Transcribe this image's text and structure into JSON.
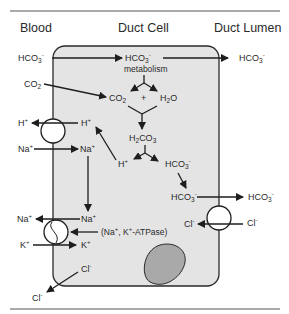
{
  "figure": {
    "headers": {
      "blood": "Blood",
      "duct_cell": "Duct Cell",
      "duct_lumen": "Duct Lumen"
    },
    "labels": {
      "hco3_blood": "HCO3-",
      "hco3_cell_top": "HCO3-",
      "metabolism": "metabolism",
      "hco3_lumen_top": "HCO3-",
      "co2_blood": "CO2",
      "co2_cell": "CO2",
      "plus": "+",
      "h2o": "H2O",
      "h_blood": "H+",
      "h_cell": "H+",
      "na_blood": "Na+",
      "na_cell": "Na+",
      "h2co3": "H2CO3",
      "h_dissoc": "H+",
      "hco3_dissoc": "HCO3-",
      "hco3_apical": "HCO3-",
      "hco3_lumen": "HCO3-",
      "cl_cell_apical": "Cl-",
      "cl_lumen": "Cl-",
      "na_blood_pump": "Na+",
      "na_cell_pump": "Na+",
      "atpase": "(Na+, K+-ATPase)",
      "k_blood": "K+",
      "k_cell": "K+",
      "cl_cell_basal": "Cl-",
      "cl_blood": "Cl-"
    },
    "colors": {
      "cell_fill": "#e4e4e4",
      "cell_stroke": "#2a2a2a",
      "nucleus_fill": "#a9a9a9",
      "line": "#1e1e1e",
      "text": "#2a2a2a"
    }
  }
}
